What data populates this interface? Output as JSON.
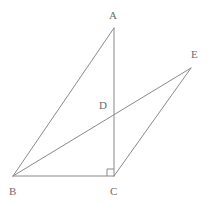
{
  "figure": {
    "kind": "geometry-diagram",
    "width": 211,
    "height": 205,
    "background_color": "#ffffff",
    "stroke_color": "#8a8a8a",
    "label_color": "#6e6e6e",
    "stroke_width": 1
  },
  "points": {
    "A": {
      "label": "A",
      "x": 114,
      "y": 28,
      "label_x": 109,
      "label_y": 10
    },
    "B": {
      "label": "B",
      "x": 13,
      "y": 176,
      "label_x": 9,
      "label_y": 186
    },
    "C": {
      "label": "C",
      "x": 114,
      "y": 176,
      "label_x": 110,
      "label_y": 186
    },
    "D": {
      "label": "D",
      "x": 114,
      "y": 110,
      "label_x": 99,
      "label_y": 100
    },
    "E": {
      "label": "E",
      "x": 191,
      "y": 68,
      "label_x": 191,
      "label_y": 49
    }
  },
  "segments": [
    {
      "name": "segment-AB",
      "from": "A",
      "to": "B"
    },
    {
      "name": "segment-AC",
      "from": "A",
      "to": "C"
    },
    {
      "name": "segment-BC",
      "from": "B",
      "to": "C"
    },
    {
      "name": "segment-BE",
      "from": "B",
      "to": "E"
    },
    {
      "name": "segment-CE",
      "from": "C",
      "to": "E"
    }
  ],
  "right_angle": {
    "name": "right-angle-at-C",
    "at_vertex": "C",
    "size": 7,
    "description": "square marker indicating 90 degrees between CB and CA"
  },
  "geometry_paths": {
    "segment_AB": "M 114 28 L 13 176",
    "segment_AC": "M 114 28 L 114 176",
    "segment_BC": "M 13 176 L 114 176",
    "segment_BE": "M 13 176 L 191 68",
    "segment_CE": "M 114 176 L 191 68",
    "right_angle_marker": "M 107 176 L 107 169 L 114 169"
  }
}
